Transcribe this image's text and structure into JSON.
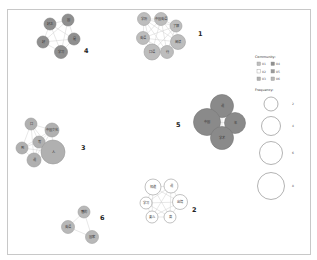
{
  "legend": {
    "community_title": "Community:",
    "communities": [
      {
        "id": "01",
        "color": "#bdbdbd"
      },
      {
        "id": "02",
        "color": "#ffffff"
      },
      {
        "id": "03",
        "color": "#b0b0b0"
      },
      {
        "id": "04",
        "color": "#8f8f8f"
      },
      {
        "id": "05",
        "color": "#9a9a9a"
      },
      {
        "id": "06",
        "color": "#b8b8b8"
      }
    ],
    "frequency_title": "Frequency:",
    "frequencies": [
      {
        "value": "2",
        "r": 7
      },
      {
        "value": "4",
        "r": 9.5
      },
      {
        "value": "6",
        "r": 11.5
      },
      {
        "value": "8",
        "r": 13.5
      }
    ]
  },
  "communities": [
    {
      "id": "1",
      "label": "1",
      "label_pos": [
        198,
        36
      ],
      "color": "#bdbdbd",
      "stroke": "#a0a0a0",
      "nodes": [
        {
          "label": "学历",
          "x": 144,
          "y": 19,
          "r": 6.5
        },
        {
          "label": "中国英语",
          "x": 161,
          "y": 19,
          "r": 6.5
        },
        {
          "label": "了解",
          "x": 176,
          "y": 26,
          "r": 6
        },
        {
          "label": "英语",
          "x": 143,
          "y": 38,
          "r": 6.5
        },
        {
          "label": "阅读",
          "x": 178,
          "y": 42,
          "r": 7.5
        },
        {
          "label": "口语",
          "x": 152,
          "y": 52,
          "r": 8
        },
        {
          "label": "行",
          "x": 167,
          "y": 52,
          "r": 6.5
        }
      ]
    },
    {
      "id": "2",
      "label": "2",
      "label_pos": [
        192,
        212
      ],
      "color": "#ffffff",
      "stroke": "#999999",
      "nodes": [
        {
          "label": "知道",
          "x": 153,
          "y": 187,
          "r": 8
        },
        {
          "label": "说",
          "x": 171,
          "y": 186,
          "r": 7
        },
        {
          "label": "学习",
          "x": 146,
          "y": 203,
          "r": 6
        },
        {
          "label": "出境",
          "x": 180,
          "y": 202,
          "r": 7.5
        },
        {
          "label": "要么",
          "x": 152,
          "y": 217,
          "r": 6
        },
        {
          "label": "高",
          "x": 170,
          "y": 217,
          "r": 6
        }
      ]
    },
    {
      "id": "3",
      "label": "3",
      "label_pos": [
        81,
        150
      ],
      "color": "#b0b0b0",
      "stroke": "#9a9a9a",
      "nodes": [
        {
          "label": "口",
          "x": 31,
          "y": 124,
          "r": 6
        },
        {
          "label": "中国文化",
          "x": 52,
          "y": 130,
          "r": 7
        },
        {
          "label": "写",
          "x": 39,
          "y": 142,
          "r": 6
        },
        {
          "label": "到",
          "x": 22,
          "y": 148,
          "r": 6
        },
        {
          "label": "人",
          "x": 53,
          "y": 152,
          "r": 12
        },
        {
          "label": "说",
          "x": 34,
          "y": 160,
          "r": 7
        }
      ]
    },
    {
      "id": "4",
      "label": "4",
      "label_pos": [
        84,
        53
      ],
      "color": "#8f8f8f",
      "stroke": "#7d7d7d",
      "nodes": [
        {
          "label": "好之",
          "x": 50,
          "y": 24,
          "r": 6
        },
        {
          "label": "国",
          "x": 68,
          "y": 20,
          "r": 6
        },
        {
          "label": "好",
          "x": 43,
          "y": 42,
          "r": 6
        },
        {
          "label": "是",
          "x": 74,
          "y": 39,
          "r": 6
        },
        {
          "label": "学习",
          "x": 61,
          "y": 52,
          "r": 6.5
        }
      ]
    },
    {
      "id": "5",
      "label": "5",
      "label_pos": [
        176,
        127
      ],
      "color": "#8a8a8a",
      "stroke": "#777777",
      "nodes": [
        {
          "label": "说",
          "x": 222,
          "y": 106,
          "r": 11.5
        },
        {
          "label": "中国",
          "x": 207,
          "y": 122,
          "r": 13.5
        },
        {
          "label": "年",
          "x": 235,
          "y": 123,
          "r": 10.5
        },
        {
          "label": "学术",
          "x": 222,
          "y": 138,
          "r": 11.5
        }
      ]
    },
    {
      "id": "6",
      "label": "6",
      "label_pos": [
        100,
        220
      ],
      "color": "#b8b8b8",
      "stroke": "#a0a0a0",
      "nodes": [
        {
          "label": "懂的",
          "x": 84,
          "y": 212,
          "r": 6
        },
        {
          "label": "英语",
          "x": 68,
          "y": 227,
          "r": 6.5
        },
        {
          "label": "国家",
          "x": 92,
          "y": 237,
          "r": 6.5
        }
      ]
    }
  ]
}
